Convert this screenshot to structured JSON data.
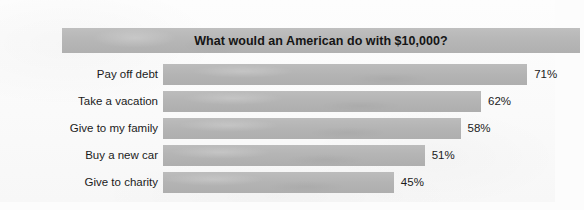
{
  "chart_data": {
    "type": "bar",
    "orientation": "horizontal",
    "title": "What would an American do with $10,000?",
    "xlabel": "",
    "ylabel": "",
    "xlim": [
      0,
      100
    ],
    "grid": false,
    "legend": false,
    "value_suffix": "%",
    "categories": [
      "Pay off debt",
      "Take a vacation",
      "Give to my family",
      "Buy a new car",
      "Give to charity"
    ],
    "values": [
      71,
      62,
      58,
      51,
      45
    ],
    "value_labels": [
      "71%",
      "62%",
      "58%",
      "51%",
      "45%"
    ],
    "bars": [
      {
        "category": "Pay off debt",
        "value": 71,
        "label": "71%"
      },
      {
        "category": "Take a vacation",
        "value": 62,
        "label": "62%"
      },
      {
        "category": "Give to my family",
        "value": 58,
        "label": "58%"
      },
      {
        "category": "Buy a new car",
        "value": 51,
        "label": "51%"
      },
      {
        "category": "Give to charity",
        "value": 45,
        "label": "45%"
      }
    ],
    "colors": {
      "bar": "#b4b4b4",
      "title_band": "#b6b6b6",
      "title_text": "#151515",
      "label_text": "#1b1b1b",
      "background": "#fcfcfc"
    },
    "layout": {
      "bar_start_px": 123,
      "px_per_percent": 5.13,
      "bar_height_px": 21,
      "row_pitch_px": 27
    }
  }
}
